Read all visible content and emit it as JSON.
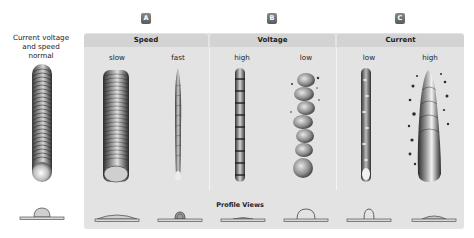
{
  "reference": {
    "label_lines": [
      "Current voltage",
      "and speed",
      "normal"
    ],
    "profile": "normal-dome"
  },
  "groups": [
    {
      "badge": "A",
      "title": "Speed",
      "columns": [
        {
          "label": "slow",
          "bead": "wide-smooth",
          "profile": "wide-flat"
        },
        {
          "label": "fast",
          "bead": "narrow-thin",
          "profile": "narrow-tall"
        }
      ]
    },
    {
      "badge": "B",
      "title": "Voltage",
      "columns": [
        {
          "label": "high",
          "bead": "narrow-rippled",
          "profile": "flat-low"
        },
        {
          "label": "low",
          "bead": "irregular-spatter",
          "profile": "high-dome"
        }
      ]
    },
    {
      "badge": "C",
      "title": "Current",
      "columns": [
        {
          "label": "low",
          "bead": "narrow-rippled",
          "profile": "tall-narrow-dome"
        },
        {
          "label": "high",
          "bead": "wide-heavy-spatter",
          "profile": "flat-wide"
        }
      ]
    }
  ],
  "profile_views_label": "Profile Views",
  "colors": {
    "panel_bg": "#e3e3e3",
    "header_bg": "#d3d3d3",
    "badge_bg": "#6e6e6e",
    "divider": "#f4f4f4"
  }
}
